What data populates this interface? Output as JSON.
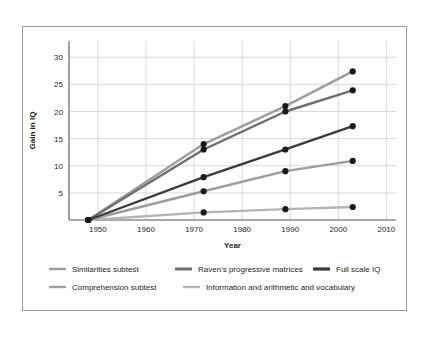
{
  "chart_data": {
    "type": "line",
    "title": "",
    "xlabel": "Year",
    "ylabel": "Gain in IQ",
    "xlim": [
      1944,
      2012
    ],
    "ylim": [
      0,
      33
    ],
    "xticks": [
      "1950",
      "1960",
      "1970",
      "1980",
      "1990",
      "2000",
      "2010"
    ],
    "xtick_values": [
      1950,
      1960,
      1970,
      1980,
      1990,
      2000,
      2010
    ],
    "yticks": [
      "5",
      "10",
      "15",
      "20",
      "25",
      "30"
    ],
    "ytick_values": [
      5,
      10,
      15,
      20,
      25,
      30
    ],
    "grid": true,
    "legend_position": "bottom",
    "x": [
      1948,
      1972,
      1989,
      2003
    ],
    "series": [
      {
        "name": "Similarities subtest",
        "color": "#9d9d9d",
        "values": [
          0,
          14.0,
          21.0,
          27.4
        ]
      },
      {
        "name": "Raven's progressive matrices",
        "color": "#6e6e6e",
        "values": [
          0,
          13.0,
          20.0,
          23.9
        ]
      },
      {
        "name": "Full scale IQ",
        "color": "#3b3b3b",
        "values": [
          0,
          7.9,
          13.0,
          17.3
        ]
      },
      {
        "name": "Comprehension subtest",
        "color": "#9d9d9d",
        "values": [
          0,
          5.3,
          9.0,
          10.9
        ]
      },
      {
        "name": "Information and arithmetic and vocabulary",
        "color": "#b4b4b4",
        "values": [
          0,
          1.4,
          2.0,
          2.4
        ]
      }
    ],
    "marker_color": "#1a1a1a"
  },
  "legend": {
    "rows": [
      [
        {
          "label": "Similarities subtest",
          "color": "#9d9d9d",
          "width": 2.4
        },
        {
          "label": "Raven's progressive matrices",
          "color": "#6e6e6e",
          "width": 3.0
        },
        {
          "label": "Full scale IQ",
          "color": "#3b3b3b",
          "width": 3.2
        }
      ],
      [
        {
          "label": "Comprehension subtest",
          "color": "#9d9d9d",
          "width": 2.4
        },
        {
          "label": "Information and arithmetic and vocabulary",
          "color": "#b4b4b4",
          "width": 2.4
        }
      ]
    ]
  },
  "colors": {
    "frame_border": "#9a9a9a",
    "grid": "#cfcfcf",
    "axis": "#555555",
    "text": "#231f20",
    "background": "#ffffff"
  }
}
